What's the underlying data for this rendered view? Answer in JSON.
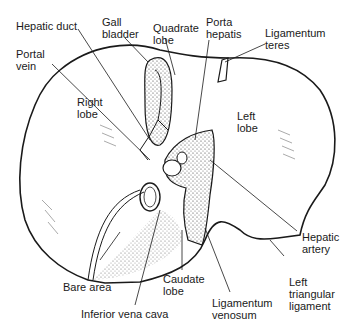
{
  "diagram": {
    "labels": {
      "hepatic_duct": "Hepatic duct",
      "gall_bladder": "Gall\nbladder",
      "quadrate_lobe": "Quadrate\nlobe",
      "porta_hepatis": "Porta\nhepatis",
      "ligamentum_teres": "Ligamentum\nteres",
      "portal_vein": "Portal\nvein",
      "right_lobe": "Right\nlobe",
      "left_lobe": "Left\nlobe",
      "hepatic_artery": "Hepatic\nartery",
      "left_triangular_ligament": "Left\ntriangular\nligament",
      "caudate_lobe": "Caudate\nlobe",
      "ligamentum_venosum": "Ligamentum\nvenosum",
      "bare_area": "Bare area",
      "inferior_vena_cava": "Inferior vena cava"
    },
    "colors": {
      "ink": "#1a1a1a",
      "background": "#ffffff"
    }
  }
}
